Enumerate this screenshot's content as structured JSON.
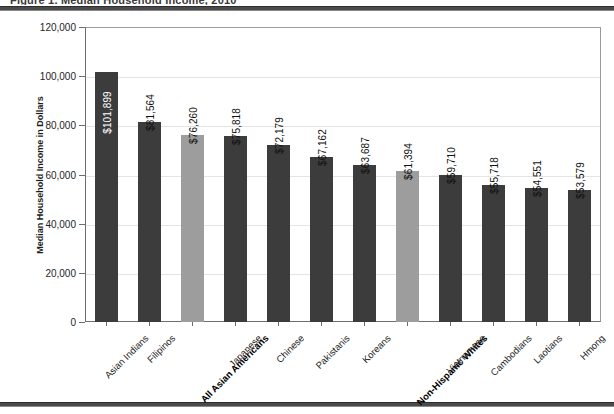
{
  "figure": {
    "title_sliver": "Figure 1. Median Household Income, 2010",
    "frame_color": "#4a4a4a"
  },
  "chart_data": {
    "type": "bar",
    "title": "",
    "xlabel": "",
    "ylabel": "Median Household Income in Dollars",
    "ylim": [
      0,
      120000
    ],
    "ytick_labels": [
      "120,000",
      "100,000",
      "80,000",
      "60,000",
      "40,000",
      "20,000",
      "0"
    ],
    "ytick_values": [
      120000,
      100000,
      80000,
      60000,
      40000,
      20000,
      0
    ],
    "grid": true,
    "legend": "none",
    "bar_color": "#3c3c3c",
    "highlight_color": "#9d9d9d",
    "categories": [
      "Asian Indians",
      "Filipinos",
      "All Asian Americans",
      "Japanese",
      "Chinese",
      "Pakistanis",
      "Koreans",
      "Non-Hispanic Whites",
      "Vietnamese",
      "Cambodians",
      "Laotians",
      "Hmong"
    ],
    "values": [
      101899,
      81564,
      76260,
      75818,
      72179,
      67162,
      63687,
      61394,
      59710,
      55718,
      54551,
      53579
    ],
    "value_labels": [
      "$101,899",
      "$81,564",
      "$76,260",
      "$75,818",
      "$72,179",
      "$67,162",
      "$63,687",
      "$61,394",
      "$59,710",
      "$55,718",
      "$54,551",
      "$53,579"
    ],
    "highlighted": [
      false,
      false,
      true,
      false,
      false,
      false,
      false,
      true,
      false,
      false,
      false,
      false
    ],
    "bold_labels": [
      false,
      false,
      true,
      false,
      false,
      false,
      false,
      true,
      false,
      false,
      false,
      false
    ],
    "label_inside_bar": [
      true,
      false,
      false,
      false,
      false,
      false,
      false,
      false,
      false,
      false,
      false,
      false
    ]
  }
}
